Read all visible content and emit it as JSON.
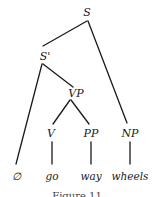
{
  "diagram": {
    "type": "syntax-tree",
    "nodes": {
      "S": {
        "label": "S",
        "x": 87,
        "y": 8
      },
      "S_bar": {
        "label": "S'",
        "x": 45,
        "y": 52
      },
      "VP": {
        "label": "VP",
        "x": 75,
        "y": 88
      },
      "V": {
        "label": "V",
        "x": 51,
        "y": 128
      },
      "PP": {
        "label": "PP",
        "x": 91,
        "y": 128
      },
      "NP": {
        "label": "NP",
        "x": 130,
        "y": 128
      },
      "empty": {
        "label": "∅",
        "x": 16,
        "y": 172
      },
      "go": {
        "label": "go",
        "x": 51,
        "y": 172
      },
      "way": {
        "label": "way",
        "x": 91,
        "y": 172
      },
      "wheels": {
        "label": "wheels",
        "x": 130,
        "y": 172
      }
    },
    "edges": [
      [
        "S",
        "S_bar"
      ],
      [
        "S",
        "NP"
      ],
      [
        "S_bar",
        "empty"
      ],
      [
        "S_bar",
        "VP"
      ],
      [
        "VP",
        "V"
      ],
      [
        "VP",
        "PP"
      ],
      [
        "V",
        "go"
      ],
      [
        "PP",
        "way"
      ],
      [
        "NP",
        "wheels"
      ]
    ],
    "caption": "Figure 11"
  }
}
